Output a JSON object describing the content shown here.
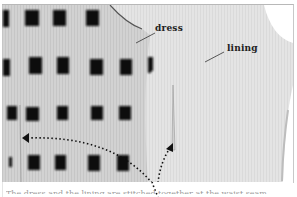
{
  "image": {
    "description": "Photograph of a patterned dress fabric with a pale lining, annotated with labels and dotted arrows",
    "labels": [
      {
        "text": "dress",
        "x": 155,
        "y": 9
      },
      {
        "text": "lining",
        "x": 227,
        "y": 38
      }
    ],
    "arrows": [
      {
        "style": "dotted",
        "from": [
          152,
          194
        ],
        "to": [
          22,
          133
        ]
      },
      {
        "style": "dotted",
        "from": [
          156,
          194
        ],
        "to": [
          172,
          143
        ]
      }
    ],
    "caption": "The dress and the lining are stitched together at the waist seam",
    "colors": {
      "background": "#ffffff",
      "lining": "#e6e6e6",
      "dress_base": "#cfcfcf",
      "pattern": "#111111",
      "label_text": "#222222"
    }
  }
}
